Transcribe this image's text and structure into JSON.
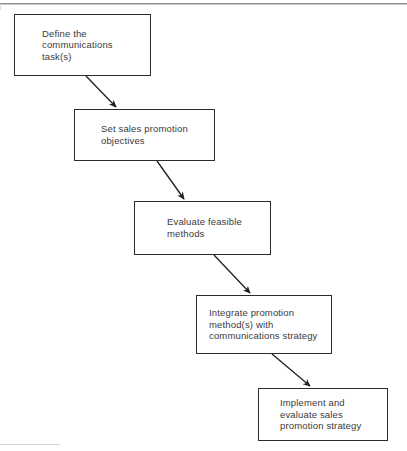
{
  "diagram": {
    "orientation": "top-left to bottom-right cascade",
    "background_color": "#ffffff",
    "line_color": "#2b2b2b",
    "text_color": "#3a3a3a",
    "nodes": [
      {
        "id": "define-communications-task",
        "label": "Define the\ncommunications\ntask(s)",
        "step": 1
      },
      {
        "id": "set-sales-promotion-objectives",
        "label": "Set sales promotion\nobjectives",
        "step": 2
      },
      {
        "id": "evaluate-feasible-methods",
        "label": "Evaluate feasible\nmethods",
        "step": 3
      },
      {
        "id": "integrate-promotion-methods",
        "label": "Integrate promotion\nmethod(s) with\ncommunications strategy",
        "step": 4
      },
      {
        "id": "implement-and-evaluate",
        "label": "Implement and\nevaluate sales\npromotion strategy",
        "step": 5
      }
    ],
    "connectors": [
      {
        "id": "arrow-1-to-2",
        "from": "define-communications-task",
        "to": "set-sales-promotion-objectives"
      },
      {
        "id": "arrow-2-to-3",
        "from": "set-sales-promotion-objectives",
        "to": "evaluate-feasible-methods"
      },
      {
        "id": "arrow-3-to-4",
        "from": "evaluate-feasible-methods",
        "to": "integrate-promotion-methods"
      },
      {
        "id": "arrow-4-to-5",
        "from": "integrate-promotion-methods",
        "to": "implement-and-evaluate"
      }
    ]
  }
}
